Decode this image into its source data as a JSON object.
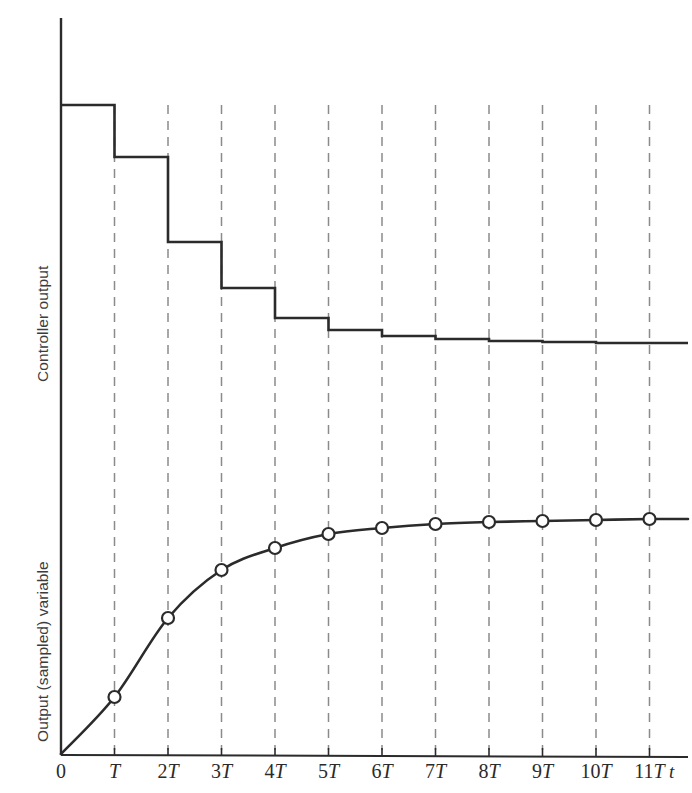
{
  "figure": {
    "background_color": "#ffffff",
    "line_color": "#2b2b2b",
    "grid_color": "#8a8a8a",
    "label_color": "#3c3c3c"
  },
  "axes": {
    "y_label_upper": "Controller output",
    "y_label_lower": "Output (sampled) variable",
    "x_axis_name": "t",
    "x_tick_labels": [
      "0",
      "T",
      "2T",
      "3T",
      "4T",
      "5T",
      "6T",
      "7T",
      "8T",
      "9T",
      "10T",
      "11T"
    ]
  },
  "chart_data": {
    "type": "line",
    "title": "",
    "xlabel": "t",
    "ylabel": "",
    "grid": true,
    "legend_position": "none",
    "x": [
      0,
      1,
      2,
      3,
      4,
      5,
      6,
      7,
      8,
      9,
      10,
      11
    ],
    "x_tick_labels": [
      "0",
      "T",
      "2T",
      "3T",
      "4T",
      "5T",
      "6T",
      "7T",
      "8T",
      "9T",
      "10T",
      "11T"
    ],
    "xlim": [
      0,
      11.6
    ],
    "series": [
      {
        "name": "Controller output",
        "type": "step",
        "drawstyle": "steps-post",
        "axis_label": "Controller output",
        "values": [
          1.0,
          0.785,
          0.435,
          0.245,
          0.125,
          0.082,
          0.058,
          0.047,
          0.04,
          0.034,
          0.03,
          0.028
        ],
        "ylim": [
          0,
          1.1
        ],
        "marker": "none"
      },
      {
        "name": "Output (sampled) variable",
        "type": "line",
        "axis_label": "Output (sampled) variable",
        "values": [
          0.0,
          0.275,
          0.662,
          0.898,
          1.005,
          1.07,
          1.1,
          1.118,
          1.13,
          1.138,
          1.142,
          1.145
        ],
        "ylim": [
          0,
          1.35
        ],
        "marker": "open-circle",
        "marker_face_color": "#ffffff",
        "marker_edge_color": "#2b2b2b"
      }
    ]
  },
  "geometry": {
    "origin_x": 61,
    "origin_y": 755,
    "y_axis_top": 18,
    "x_axis_right": 688,
    "tick_spacing": 53.5,
    "gridline_top": 105,
    "gridline_bottom": 750,
    "step_levels": [
      105,
      157,
      242,
      288,
      318,
      330,
      336,
      339,
      341,
      342,
      343,
      343
    ],
    "step_right_end": 688,
    "curve_points_y": [
      754,
      697,
      618,
      570,
      548,
      534,
      528,
      524,
      522,
      521,
      520,
      519
    ],
    "curve_right_end_y": 519,
    "marker_radius": 6
  }
}
